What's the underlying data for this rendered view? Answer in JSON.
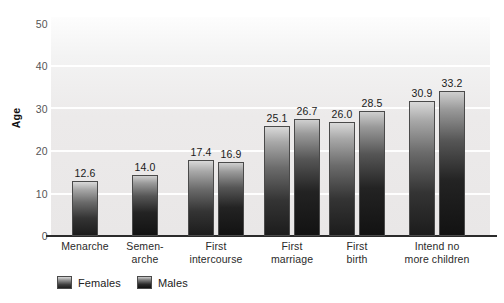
{
  "chart_data": {
    "type": "bar",
    "title": "",
    "xlabel": "",
    "ylabel": "Age",
    "ylim": [
      0,
      50
    ],
    "yticks": [
      0,
      10,
      20,
      30,
      40,
      50
    ],
    "grid": true,
    "legend_position": "bottom-left",
    "categories": [
      "Menarche",
      "Semen-\narche",
      "First\nintercourse",
      "First\nmarriage",
      "First\nbirth",
      "Intend no\nmore children"
    ],
    "series": [
      {
        "name": "Females",
        "values": [
          12.6,
          null,
          17.4,
          25.1,
          26.0,
          30.9
        ]
      },
      {
        "name": "Males",
        "values": [
          null,
          14.0,
          16.9,
          26.7,
          28.5,
          33.2
        ]
      }
    ],
    "data_labels": {
      "females": [
        "12.6",
        "",
        "17.4",
        "25.1",
        "26.0",
        "30.9"
      ],
      "males": [
        "",
        "14.0",
        "16.9",
        "26.7",
        "28.5",
        "33.2"
      ]
    }
  },
  "axis": {
    "y_title": "Age",
    "y_tick_labels": [
      "50",
      "40",
      "30",
      "20",
      "10",
      "0"
    ]
  },
  "legend": {
    "items": [
      {
        "label": "Females",
        "swatch": "females-swatch"
      },
      {
        "label": "Males",
        "swatch": "males-swatch"
      }
    ]
  },
  "colors": {
    "plot_background": "#ececec",
    "gridline": "#ffffff",
    "axis_line": "#2b2b2b",
    "bar_females_top": "#d9d9d9",
    "bar_females_bottom": "#1c1c1c",
    "bar_males_top": "#cfcfcf",
    "bar_males_bottom": "#121212",
    "text": "#2a2a2a"
  }
}
